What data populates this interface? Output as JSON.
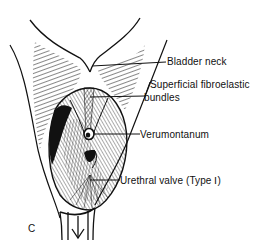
{
  "figure": {
    "panel_letter": "C",
    "colors": {
      "ink": "#111111",
      "background": "#ffffff"
    },
    "labels": [
      {
        "id": "bladder-neck",
        "text": "Bladder  neck"
      },
      {
        "id": "superficial-fibroelastic-bundles",
        "line1": "Superficial  fibroelastic",
        "line2": "bundles"
      },
      {
        "id": "verumontanum",
        "text": "Verumontanum"
      },
      {
        "id": "urethral-valve",
        "text": "Urethral  valve (Type Ⅰ)"
      }
    ],
    "flow_arrow": "down-arrow"
  }
}
